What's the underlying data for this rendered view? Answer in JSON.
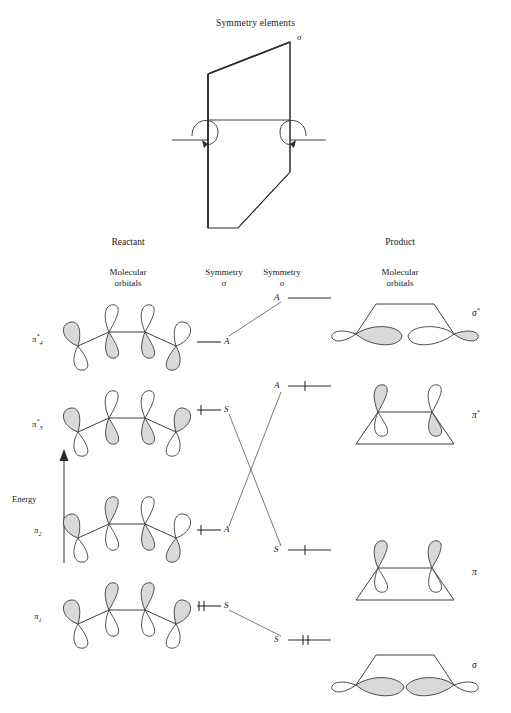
{
  "figure": {
    "title": "Symmetry elements",
    "sigma_label": "σ",
    "energy_axis_label": "Energy"
  },
  "columns": {
    "reactant_header": "Reactant",
    "product_header": "Product",
    "reactant_sub": [
      "Molecular",
      "orbitals"
    ],
    "product_sub": [
      "Molecular",
      "orbitals"
    ],
    "symmetry_left": {
      "word": "Symmetry",
      "element": "σ"
    },
    "symmetry_right": {
      "word": "Symmetry",
      "element": "σ"
    }
  },
  "reactant_orbitals": [
    {
      "name": "π₄*",
      "base": "π",
      "sub": "4",
      "star": "*",
      "symmetry": "A",
      "electrons": 0,
      "phases": [
        "up-shaded",
        "down-shaded",
        "up-shaded",
        "down-shaded"
      ]
    },
    {
      "name": "π₃*",
      "base": "π",
      "sub": "3",
      "star": "*",
      "symmetry": "S",
      "electrons": 1,
      "phases": [
        "up-shaded",
        "down-shaded",
        "down-shaded",
        "up-shaded"
      ]
    },
    {
      "name": "π₂",
      "base": "π",
      "sub": "2",
      "star": "",
      "symmetry": "A",
      "electrons": 1,
      "phases": [
        "up-shaded",
        "up-shaded",
        "down-shaded",
        "down-shaded"
      ]
    },
    {
      "name": "π₁",
      "base": "π",
      "sub": "1",
      "star": "",
      "symmetry": "S",
      "electrons": 2,
      "phases": [
        "up-shaded",
        "up-shaded",
        "up-shaded",
        "up-shaded"
      ]
    }
  ],
  "product_orbitals": [
    {
      "name": "σ*",
      "base": "σ",
      "star": "*",
      "symmetry": "A",
      "electrons": 0,
      "type": "sigma-antibonding"
    },
    {
      "name": "π*",
      "base": "π",
      "star": "*",
      "symmetry": "A",
      "electrons": 1,
      "type": "pi-antibonding"
    },
    {
      "name": "π",
      "base": "π",
      "star": "",
      "symmetry": "S",
      "electrons": 1,
      "type": "pi-bonding"
    },
    {
      "name": "σ",
      "base": "σ",
      "star": "",
      "symmetry": "S",
      "electrons": 2,
      "type": "sigma-bonding"
    }
  ],
  "correlations": [
    {
      "from": "π₄*",
      "from_symmetry": "A",
      "to": "σ*",
      "to_symmetry": "A"
    },
    {
      "from": "π₃*",
      "from_symmetry": "S",
      "to": "π",
      "to_symmetry": "S"
    },
    {
      "from": "π₂",
      "from_symmetry": "A",
      "to": "π*",
      "to_symmetry": "A"
    },
    {
      "from": "π₁",
      "from_symmetry": "S",
      "to": "σ",
      "to_symmetry": "S"
    }
  ],
  "colors": {
    "stroke": "#2a2a2a",
    "lobe_fill": "#d9d9d9",
    "lobe_empty": "#ffffff",
    "correlation_line": "#555555"
  }
}
